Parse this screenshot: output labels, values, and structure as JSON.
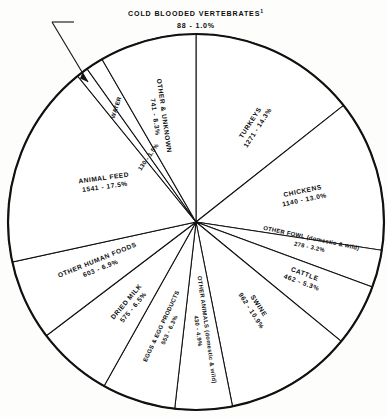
{
  "figure": {
    "callout": {
      "name": "COLD BLOODED VERTEBRATES",
      "superscript": "1",
      "value_label": "88 - 1.0%"
    }
  },
  "chart_data": {
    "type": "pie",
    "title": "",
    "units": "millions of pounds",
    "total": 8834,
    "legend_position": "on-slice",
    "grid": false,
    "start_angle_deg": 0,
    "direction": "clockwise",
    "categories": [
      "TURKEYS",
      "CHICKENS",
      "OTHER FOWL (domestic & wild)",
      "CATTLE",
      "SWINE",
      "OTHER ANIMALS (domestic & wild)",
      "EGGS & EGG PRODUCTS",
      "DRIED MILK",
      "OTHER HUMAN FOODS",
      "ANIMAL FEED",
      "COLD BLOODED VERTEBRATES",
      "WATER",
      "OTHER & UNKNOWN"
    ],
    "values": [
      1271,
      1140,
      278,
      462,
      962,
      430,
      553,
      575,
      603,
      1541,
      88,
      130,
      741
    ],
    "percents": [
      14.3,
      13.0,
      3.2,
      5.3,
      10.9,
      4.9,
      6.3,
      6.5,
      6.9,
      17.5,
      1.0,
      1.5,
      8.3
    ],
    "slices": [
      {
        "name": "TURKEYS",
        "name_line2": "",
        "value": 1271,
        "percent": 14.3,
        "value_label": "1271 - 14.3%"
      },
      {
        "name": "CHICKENS",
        "name_line2": "",
        "value": 1140,
        "percent": 13.0,
        "value_label": "1140 - 13.0%"
      },
      {
        "name": "OTHER FOWL (domestic & wild)",
        "name_line2": "",
        "value": 278,
        "percent": 3.2,
        "value_label": "278 - 3.2%"
      },
      {
        "name": "CATTLE",
        "name_line2": "",
        "value": 462,
        "percent": 5.3,
        "value_label": "462 - 5.3%"
      },
      {
        "name": "SWINE",
        "name_line2": "",
        "value": 962,
        "percent": 10.9,
        "value_label": "962 - 10.9%"
      },
      {
        "name": "OTHER ANIMALS (domestic & wild)",
        "name_line2": "",
        "value": 430,
        "percent": 4.9,
        "value_label": "430 - 4.9%"
      },
      {
        "name": "EGGS & EGG PRODUCTS",
        "name_line2": "",
        "value": 553,
        "percent": 6.3,
        "value_label": "553 - 6.3%"
      },
      {
        "name": "DRIED MILK",
        "name_line2": "",
        "value": 575,
        "percent": 6.5,
        "value_label": "575 - 6.5%"
      },
      {
        "name": "OTHER HUMAN FOODS",
        "name_line2": "",
        "value": 603,
        "percent": 6.9,
        "value_label": "603 - 6.9%"
      },
      {
        "name": "ANIMAL FEED",
        "name_line2": "",
        "value": 1541,
        "percent": 17.5,
        "value_label": "1541 - 17.5%"
      },
      {
        "name": "COLD BLOODED VERTEBRATES",
        "name_line2": "",
        "value": 88,
        "percent": 1.0,
        "value_label": "88 - 1.0%"
      },
      {
        "name": "WATER",
        "name_line2": "",
        "value": 130,
        "percent": 1.5,
        "value_label": "130 - 1.5%"
      },
      {
        "name": "OTHER & UNKNOWN",
        "name_line2": "",
        "value": 741,
        "percent": 8.3,
        "value_label": "741 - 8.3%"
      }
    ]
  },
  "labels": {
    "turkeys_name": "TURKEYS",
    "turkeys_value": "1271 - 14.3%",
    "chickens_name": "CHICKENS",
    "chickens_value": "1140 - 13.0%",
    "other_fowl_name": "OTHER FOWL (domestic & wild)",
    "other_fowl_value": "278 - 3.2%",
    "cattle_name": "CATTLE",
    "cattle_value": "462 - 5.3%",
    "swine_name": "SWINE",
    "swine_value": "962 - 10.9%",
    "other_animals_name": "OTHER ANIMALS (domestic & wild)",
    "other_animals_value": "430 - 4.9%",
    "eggs_name": "EGGS & EGG PRODUCTS",
    "eggs_value": "553 - 6.3%",
    "dried_milk_name": "DRIED MILK",
    "dried_milk_value": "575 - 6.5%",
    "other_human_foods_name": "OTHER HUMAN FOODS",
    "other_human_foods_value": "603 - 6.9%",
    "animal_feed_name": "ANIMAL FEED",
    "animal_feed_value": "1541 - 17.5%",
    "water_name": "WATER",
    "water_value": "130 - 1.5%",
    "other_unknown_name": "OTHER & UNKNOWN",
    "other_unknown_value": "741 - 8.3%",
    "cold_blooded_name": "COLD BLOODED VERTEBRATES",
    "cold_blooded_sup": "1",
    "cold_blooded_value": "88 - 1.0%"
  }
}
